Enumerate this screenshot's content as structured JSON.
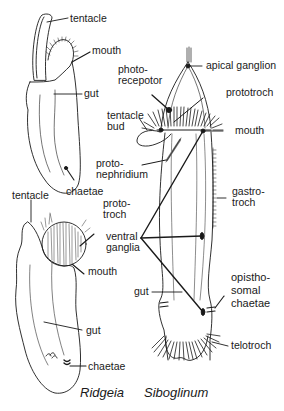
{
  "figure": {
    "type": "anatomical-comparison-diagram",
    "species": [
      "Ridgeia",
      "Siboglinum"
    ]
  },
  "ridgeia_adult": {
    "labels": {
      "tentacle": "tentacle",
      "mouth": "mouth",
      "gut": "gut",
      "chaetae": "chaetae"
    }
  },
  "ridgeia_larva": {
    "labels": {
      "tentacle": "tentacle",
      "prototroch": "proto-\ntroch",
      "mouth": "mouth",
      "gut": "gut",
      "chaetae": "chaetae"
    },
    "species_name": "Ridgeia"
  },
  "siboglinum": {
    "labels": {
      "apical_ganglion": "apical ganglion",
      "photoreceptor": "photo-\nrecepotor",
      "prototroch": "prototroch",
      "tentacle_bud": "tentacle\nbud",
      "mouth": "mouth",
      "protonephridium": "proto-\nnephridium",
      "gastrotroch": "gastro-\ntroch",
      "ventral_ganglia": "ventral\nganglia",
      "gut": "gut",
      "opisthosomal_chaetae": "opistho-\nsomal\nchaetae",
      "telotroch": "telotroch"
    },
    "species_name": "Siboglinum"
  },
  "colors": {
    "ink": "#1a1a1a",
    "background": "#ffffff"
  }
}
